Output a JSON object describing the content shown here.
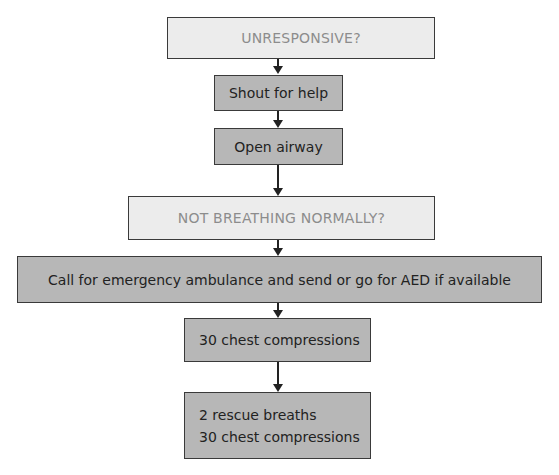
{
  "flowchart": {
    "steps": [
      {
        "id": "unresponsive",
        "label": "UNRESPONSIVE?",
        "type": "question"
      },
      {
        "id": "shout",
        "label": "Shout for help",
        "type": "action"
      },
      {
        "id": "open-airway",
        "label": "Open airway",
        "type": "action"
      },
      {
        "id": "not-breathing",
        "label": "NOT BREATHING NORMALLY?",
        "type": "question"
      },
      {
        "id": "call",
        "label": "Call for emergency ambulance and send or go for AED if available",
        "type": "action"
      },
      {
        "id": "compressions",
        "label": "30 chest compressions",
        "type": "action"
      },
      {
        "id": "cycle",
        "lines": [
          "2 rescue breaths",
          "30 chest compressions"
        ],
        "type": "action"
      }
    ],
    "colors": {
      "question_fill": "#ececec",
      "question_text": "#8c8c8c",
      "action_fill": "#b7b7b7",
      "border": "#3a3a3a"
    }
  }
}
